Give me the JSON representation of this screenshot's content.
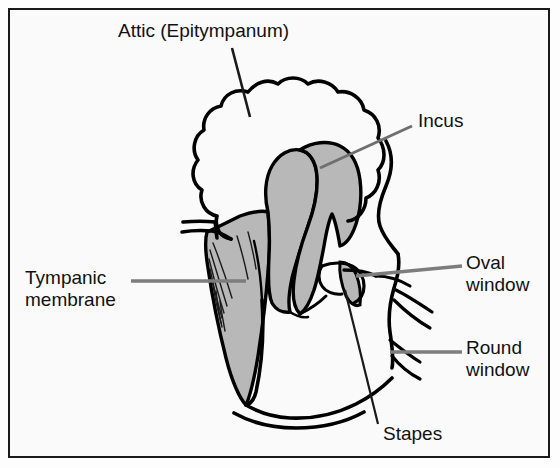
{
  "figure": {
    "background_color": "#fafafa",
    "border_color": "#1a1a1a",
    "ink_color": "#000000",
    "shade_color": "#b8b8b8",
    "leader_gray": "#808080"
  },
  "labels": {
    "attic": "Attic (Epitympanum)",
    "incus": "Incus",
    "tympanic_membrane": "Tympanic\nmembrane",
    "oval_window": "Oval\nwindow",
    "round_window": "Round\nwindow",
    "stapes": "Stapes"
  },
  "structures": [
    {
      "name": "attic-epitympanum",
      "label": "Attic (Epitympanum)",
      "fill": "none"
    },
    {
      "name": "incus",
      "label": "Incus",
      "fill": "#b8b8b8"
    },
    {
      "name": "malleus",
      "label": "Malleus",
      "fill": "#b8b8b8"
    },
    {
      "name": "tympanic-membrane",
      "label": "Tympanic membrane",
      "fill": "#b8b8b8"
    },
    {
      "name": "stapes",
      "label": "Stapes",
      "fill": "#b8b8b8"
    },
    {
      "name": "oval-window",
      "label": "Oval window",
      "fill": "none"
    },
    {
      "name": "round-window",
      "label": "Round window",
      "fill": "none"
    },
    {
      "name": "tympanic-cavity",
      "label": "Tympanic cavity",
      "fill": "none"
    }
  ]
}
